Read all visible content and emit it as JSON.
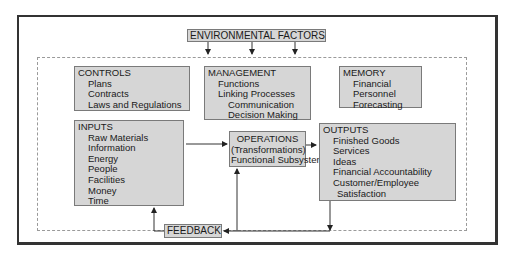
{
  "environmental_factors": {
    "label": "ENVIRONMENTAL FACTORS"
  },
  "controls": {
    "title": "CONTROLS",
    "items": [
      "Plans",
      "Contracts",
      "Laws and Regulations"
    ]
  },
  "management": {
    "title": "MANAGEMENT",
    "items": [
      "Functions",
      "Linking Processes"
    ],
    "subitems": [
      "Communication",
      "Decision Making"
    ]
  },
  "memory": {
    "title": "MEMORY",
    "items": [
      "Financial",
      "Personnel",
      "Forecasting"
    ]
  },
  "inputs": {
    "title": "INPUTS",
    "items": [
      "Raw Materials",
      "Information",
      "Energy",
      "People",
      "Facilities",
      "Money",
      "Time"
    ]
  },
  "operations": {
    "lines": [
      "OPERATIONS",
      "(Transformations)",
      "Functional Subsystems"
    ]
  },
  "outputs": {
    "title": "OUTPUTS",
    "items": [
      "Finished Goods",
      "Services",
      "Ideas",
      "Financial Accountability",
      "Customer/Employee"
    ],
    "continuation": "Satisfaction"
  },
  "feedback": {
    "label": "FEEDBACK"
  },
  "colors": {
    "box_fill": "#d6d6d6",
    "box_border": "#7a7a7a",
    "frame": "#333333",
    "dashed": "#9a9a9a"
  }
}
